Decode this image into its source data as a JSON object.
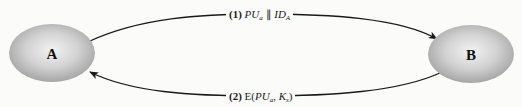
{
  "diagram": {
    "type": "protocol-exchange",
    "nodes": [
      {
        "id": "A",
        "label": "A",
        "cx": 52,
        "cy": 53,
        "rx": 43,
        "ry": 29
      },
      {
        "id": "B",
        "label": "B",
        "cx": 471,
        "cy": 54,
        "rx": 43,
        "ry": 29
      }
    ],
    "edges": [
      {
        "from": "A",
        "to": "B",
        "step": "(1)",
        "parts": {
          "pu": "PU",
          "pu_sub": "a",
          "concat": "∥",
          "id": "ID",
          "id_sub": "A"
        },
        "text": "(1) PUa ∥ IDA"
      },
      {
        "from": "B",
        "to": "A",
        "step": "(2)",
        "parts": {
          "func": "E(",
          "pu": "PU",
          "pu_sub": "a",
          "sep": ", ",
          "k": "K",
          "k_sub": "s",
          "close": ")"
        },
        "text": "(2) E(PUa, Ks)"
      }
    ],
    "colors": {
      "background": "#fbfbfa",
      "node_fill_light": "#efefef",
      "node_fill_dark": "#a9a9a9",
      "line": "#1a1a1a"
    }
  }
}
